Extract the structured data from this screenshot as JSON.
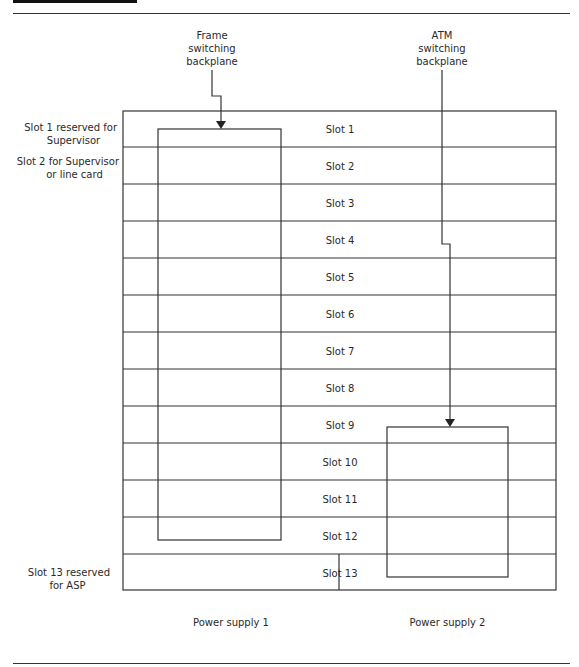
{
  "header": {
    "bar_color": "#111111"
  },
  "backplanes": {
    "frame": {
      "lines": [
        "Frame",
        "switching",
        "backplane"
      ],
      "spans_slots": "1-12"
    },
    "atm": {
      "lines": [
        "ATM",
        "switching",
        "backplane"
      ],
      "spans_slots": "9-13"
    }
  },
  "side_labels": {
    "slot1": [
      "Slot 1 reserved for",
      "Supervisor"
    ],
    "slot2": [
      "Slot 2 for Supervisor",
      "or line card"
    ],
    "slot13": [
      "Slot 13 reserved",
      "for ASP"
    ]
  },
  "slots": [
    {
      "label": "Slot 1"
    },
    {
      "label": "Slot 2"
    },
    {
      "label": "Slot 3"
    },
    {
      "label": "Slot 4"
    },
    {
      "label": "Slot 5"
    },
    {
      "label": "Slot 6"
    },
    {
      "label": "Slot 7"
    },
    {
      "label": "Slot 8"
    },
    {
      "label": "Slot 9"
    },
    {
      "label": "Slot 10"
    },
    {
      "label": "Slot 11"
    },
    {
      "label": "Slot 12"
    },
    {
      "label": "Slot 13"
    }
  ],
  "power_supplies": [
    {
      "label": "Power supply 1"
    },
    {
      "label": "Power supply 2"
    }
  ],
  "colors": {
    "line": "#333333",
    "text": "#2a2a2a"
  }
}
